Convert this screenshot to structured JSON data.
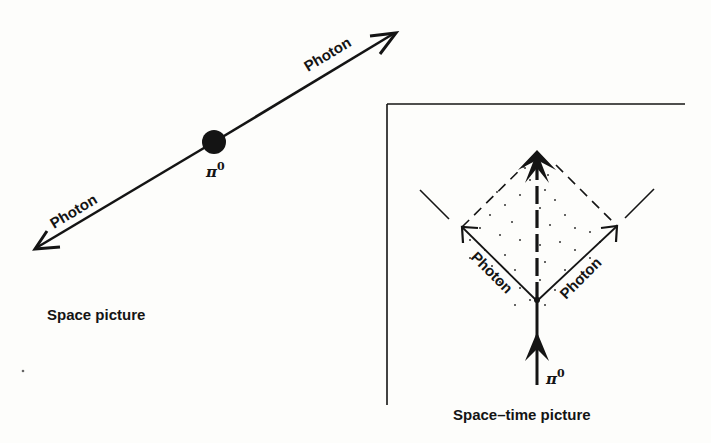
{
  "figure": {
    "space_picture": {
      "caption": "Space picture",
      "particle_label": "π",
      "particle_superscript": "0",
      "photon_labels": [
        "Photon",
        "Photon"
      ]
    },
    "spacetime_picture": {
      "caption": "Space–time picture",
      "particle_label": "π",
      "particle_superscript": "0",
      "photon_labels": [
        "Photon",
        "Photon"
      ]
    },
    "colors": {
      "ink": "#141414",
      "paper": "#fdfdfb"
    }
  }
}
